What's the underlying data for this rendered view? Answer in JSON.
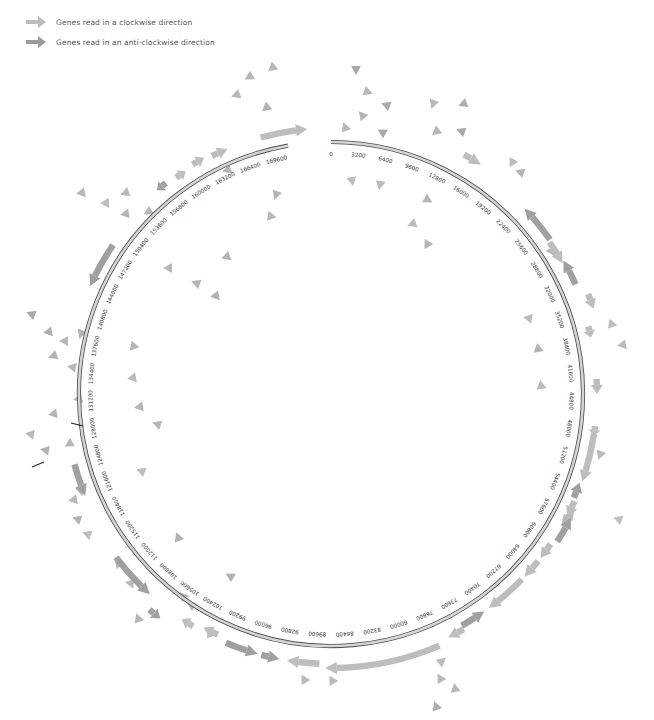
{
  "legend": {
    "items": [
      {
        "label": "Genes read in a clockwise direction",
        "color": "#b9b9b9",
        "icon": "arrow-right-icon"
      },
      {
        "label": "Genes read in an anti-clockwise direction",
        "color": "#9a9a9a",
        "icon": "arrow-right-icon"
      }
    ]
  },
  "colors": {
    "clockwise": "#bdbdbd",
    "anticlockwise": "#a0a0a0",
    "ring_fill": "#d4d4d4",
    "ring_stroke": "#4a4a4a",
    "scatter": "#b3b3b3",
    "marker": "#222222"
  },
  "ring": {
    "cx": 331,
    "cy": 394,
    "r": 252,
    "genome_length": 176000,
    "gap_start_bp": 171200,
    "gap_end_bp": 176000,
    "tick_step": 3200,
    "tick_labels": [
      "0",
      "3200",
      "6400",
      "9600",
      "12800",
      "16000",
      "19200",
      "22400",
      "25600",
      "28800",
      "32000",
      "35200",
      "38400",
      "41600",
      "44800",
      "48000",
      "51200",
      "54400",
      "57600",
      "60800",
      "64000",
      "67200",
      "70400",
      "73600",
      "76800",
      "80000",
      "83200",
      "86400",
      "89600",
      "92800",
      "96000",
      "99200",
      "102400",
      "105600",
      "108800",
      "112000",
      "115200",
      "118400",
      "121600",
      "124800",
      "128000",
      "131200",
      "134400",
      "137600",
      "140800",
      "144000",
      "147200",
      "150400",
      "153600",
      "156800",
      "160000",
      "163200",
      "166400",
      "169600"
    ]
  },
  "genes": [
    {
      "start": 168500,
      "end": 173500,
      "strand": "+",
      "offset": 14
    },
    {
      "start": 163000,
      "end": 164800,
      "strand": "+",
      "offset": 14
    },
    {
      "start": 160800,
      "end": 162200,
      "strand": "+",
      "offset": 16
    },
    {
      "start": 158600,
      "end": 159800,
      "strand": "+",
      "offset": 14
    },
    {
      "start": 156200,
      "end": 157400,
      "strand": "-",
      "offset": 16
    },
    {
      "start": 143800,
      "end": 148800,
      "strand": "-",
      "offset": 12
    },
    {
      "start": 121000,
      "end": 124500,
      "strand": "-",
      "offset": 14
    },
    {
      "start": 108600,
      "end": 113800,
      "strand": "-",
      "offset": 18
    },
    {
      "start": 106200,
      "end": 107600,
      "strand": "-",
      "offset": 30
    },
    {
      "start": 103000,
      "end": 104400,
      "strand": "+",
      "offset": 18
    },
    {
      "start": 100300,
      "end": 102000,
      "strand": "+",
      "offset": 14
    },
    {
      "start": 95700,
      "end": 99200,
      "strand": "-",
      "offset": 18
    },
    {
      "start": 93400,
      "end": 95300,
      "strand": "-",
      "offset": 18
    },
    {
      "start": 89200,
      "end": 92600,
      "strand": "+",
      "offset": 18
    },
    {
      "start": 76600,
      "end": 88600,
      "strand": "+",
      "offset": 22
    },
    {
      "start": 73600,
      "end": 75400,
      "strand": "+",
      "offset": 18
    },
    {
      "start": 70800,
      "end": 73600,
      "strand": "-",
      "offset": 14
    },
    {
      "start": 65600,
      "end": 70200,
      "strand": "+",
      "offset": 14
    },
    {
      "start": 63000,
      "end": 65200,
      "strand": "+",
      "offset": 14
    },
    {
      "start": 60800,
      "end": 62600,
      "strand": "+",
      "offset": 14
    },
    {
      "start": 57300,
      "end": 60200,
      "strand": "-",
      "offset": 18
    },
    {
      "start": 55600,
      "end": 57400,
      "strand": "+",
      "offset": 14
    },
    {
      "start": 53600,
      "end": 55300,
      "strand": "-",
      "offset": 12
    },
    {
      "start": 48200,
      "end": 53400,
      "strand": "+",
      "offset": 14
    },
    {
      "start": 47400,
      "end": 48400,
      "strand": "+",
      "offset": 14
    },
    {
      "start": 42400,
      "end": 44000,
      "strand": "+",
      "offset": 14
    },
    {
      "start": 36800,
      "end": 38000,
      "strand": "+",
      "offset": 14
    },
    {
      "start": 33600,
      "end": 35200,
      "strand": "+",
      "offset": 24
    },
    {
      "start": 29400,
      "end": 32200,
      "strand": "-",
      "offset": 16
    },
    {
      "start": 27000,
      "end": 29600,
      "strand": "+",
      "offset": 14
    },
    {
      "start": 22600,
      "end": 26800,
      "strand": "-",
      "offset": 16
    },
    {
      "start": 14200,
      "end": 16200,
      "strand": "+",
      "offset": 22
    }
  ],
  "scatter_triangles": [
    [
      356,
      70,
      "#a8a8a8",
      90
    ],
    [
      368,
      92,
      "#b8b8b8",
      20
    ],
    [
      386,
      105,
      "#aaaaaa",
      200
    ],
    [
      362,
      115,
      "#b5b5b5",
      230
    ],
    [
      345,
      127,
      "#b8b8b8",
      250
    ],
    [
      382,
      132,
      "#a8a8a8",
      210
    ],
    [
      433,
      104,
      "#bbbbbb",
      110
    ],
    [
      463,
      104,
      "#b0b0b0",
      160
    ],
    [
      436,
      132,
      "#b8b8b8",
      140
    ],
    [
      461,
      131,
      "#a9a9a9",
      200
    ],
    [
      352,
      181,
      "#bdbdbd",
      80
    ],
    [
      380,
      185,
      "#bbbbbb",
      100
    ],
    [
      428,
      200,
      "#b5b5b5",
      30
    ],
    [
      412,
      224,
      "#bdbdbd",
      160
    ],
    [
      427,
      245,
      "#b5b5b5",
      120
    ],
    [
      512,
      163,
      "#bdbdbd",
      120
    ],
    [
      520,
      172,
      "#b5b5b5",
      200
    ],
    [
      552,
      250,
      "#b9b9b9",
      300
    ],
    [
      528,
      318,
      "#bbbbbb",
      190
    ],
    [
      538,
      348,
      "#b2b2b2",
      260
    ],
    [
      541,
      385,
      "#bbbbbb",
      260
    ],
    [
      611,
      325,
      "#bdbdbd",
      130
    ],
    [
      622,
      345,
      "#bbbbbb",
      170
    ],
    [
      600,
      455,
      "#bbbbbb",
      110
    ],
    [
      618,
      519,
      "#c0c0c0",
      200
    ],
    [
      565,
      520,
      "#b8b8b8",
      130
    ],
    [
      571,
      515,
      "#bbbbbb",
      310
    ],
    [
      442,
      661,
      "#bbbbbb",
      320
    ],
    [
      440,
      678,
      "#b9b9b9",
      240
    ],
    [
      455,
      688,
      "#b8b8b8",
      260
    ],
    [
      436,
      706,
      "#b0b0b0",
      250
    ],
    [
      304,
      679,
      "#b9b9b9",
      240
    ],
    [
      332,
      680,
      "#bbbbbb",
      240
    ],
    [
      230,
      576,
      "#b3b3b3",
      210
    ],
    [
      178,
      537,
      "#b3b3b3",
      250
    ],
    [
      141,
      471,
      "#bdbdbd",
      200
    ],
    [
      157,
      424,
      "#b8b8b8",
      200
    ],
    [
      139,
      407,
      "#b5b5b5",
      170
    ],
    [
      132,
      378,
      "#bbbbbb",
      170
    ],
    [
      133,
      347,
      "#b5b5b5",
      130
    ],
    [
      226,
      257,
      "#b5b5b5",
      160
    ],
    [
      215,
      296,
      "#b2b2b2",
      170
    ],
    [
      196,
      283,
      "#b3b3b3",
      200
    ],
    [
      168,
      268,
      "#b8b8b8",
      180
    ],
    [
      270,
      217,
      "#b8b8b8",
      130
    ],
    [
      276,
      195,
      "#b5b5b5",
      110
    ],
    [
      227,
      170,
      "#b5b5b5",
      160
    ],
    [
      272,
      68,
      "#b9b9b9",
      140
    ],
    [
      249,
      77,
      "#b8b8b8",
      150
    ],
    [
      236,
      95,
      "#b8b8b8",
      160
    ],
    [
      266,
      108,
      "#b2b2b2",
      140
    ],
    [
      81,
      193,
      "#b8b8b8",
      170
    ],
    [
      105,
      203,
      "#bdbdbd",
      180
    ],
    [
      125,
      193,
      "#b8b8b8",
      160
    ],
    [
      125,
      214,
      "#b5b5b5",
      170
    ],
    [
      148,
      212,
      "#b7b7b7",
      150
    ],
    [
      31,
      314,
      "#a9a9a9",
      200
    ],
    [
      48,
      332,
      "#b2b2b2",
      170
    ],
    [
      64,
      341,
      "#b8b8b8",
      180
    ],
    [
      81,
      334,
      "#b5b5b5",
      110
    ],
    [
      53,
      356,
      "#b3b3b3",
      160
    ],
    [
      72,
      367,
      "#b7b7b7",
      190
    ],
    [
      78,
      399,
      "#b3b3b3",
      170
    ],
    [
      53,
      414,
      "#b5b5b5",
      170
    ],
    [
      30,
      434,
      "#b9b9b9",
      190
    ],
    [
      69,
      444,
      "#b8b8b8",
      150
    ],
    [
      45,
      450,
      "#b2b2b2",
      190
    ],
    [
      80,
      490,
      "#b3b3b3",
      200
    ],
    [
      77,
      519,
      "#b3b3b3",
      200
    ],
    [
      73,
      500,
      "#b7b7b7",
      170
    ],
    [
      87,
      534,
      "#bdbdbd",
      200
    ],
    [
      118,
      563,
      "#b5b5b5",
      230
    ],
    [
      130,
      583,
      "#b9b9b9",
      190
    ],
    [
      183,
      596,
      "#b7b7b7",
      230
    ],
    [
      191,
      605,
      "#b7b7b7",
      210
    ],
    [
      210,
      633,
      "#bdbdbd",
      250
    ],
    [
      138,
      618,
      "#b7b7b7",
      250
    ]
  ],
  "markers": [
    {
      "x1": 71,
      "y1": 423,
      "x2": 83,
      "y2": 426
    },
    {
      "x1": 32,
      "y1": 467,
      "x2": 44,
      "y2": 462
    }
  ]
}
